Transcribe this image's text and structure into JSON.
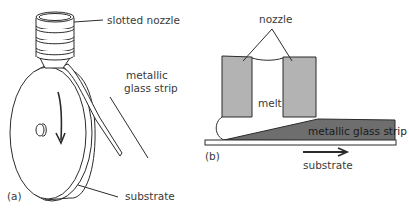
{
  "figure": {
    "panel_a": {
      "tag": "(a)",
      "labels": {
        "nozzle": "slotted nozzle",
        "strip_line1": "metallic",
        "strip_line2": "glass strip",
        "substrate": "substrate"
      }
    },
    "panel_b": {
      "tag": "(b)",
      "labels": {
        "nozzle": "nozzle",
        "melt": "melt",
        "strip": "metallic glass strip",
        "substrate": "substrate"
      }
    },
    "colors": {
      "line": "#2b2b2b",
      "nozzle_fill": "#b3b3b3",
      "strip_fill": "#6e6e6e",
      "text": "#3a3a3a"
    }
  }
}
